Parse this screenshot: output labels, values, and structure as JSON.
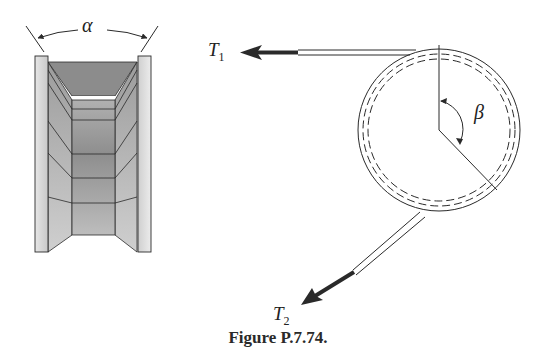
{
  "figure": {
    "caption": "Figure P.7.74.",
    "section_view": {
      "angle_label": "α",
      "description": "V-groove pulley cross-section"
    },
    "pulley_view": {
      "angle_label": "β",
      "tension_1": {
        "symbol": "T",
        "subscript": "1"
      },
      "tension_2": {
        "symbol": "T",
        "subscript": "2"
      }
    },
    "colors": {
      "line": "#2a2a2a",
      "flange_fill": "#d6d6d6",
      "groove_dark": "#8a8a8a",
      "groove_mid": "#a8a8a8",
      "groove_light": "#c4c4c4",
      "background": "#ffffff"
    }
  }
}
